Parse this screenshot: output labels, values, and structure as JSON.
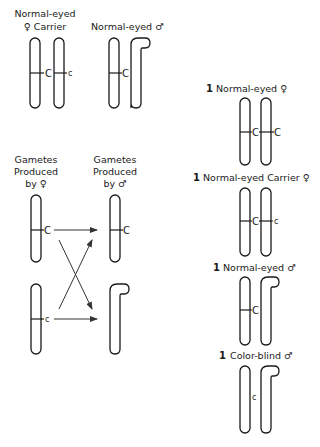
{
  "parents": {
    "female": {
      "label_line1": "Normal-eyed",
      "label_line2": "♀ Carrier",
      "alleles": [
        "C",
        "c"
      ]
    },
    "male": {
      "label": "Normal-eyed ♂",
      "alleles": [
        "C"
      ]
    }
  },
  "gametes": {
    "female_header": [
      "Gametes",
      "Produced",
      "by ♀"
    ],
    "male_header": [
      "Gametes",
      "Produced",
      "by ♂"
    ],
    "female_alleles": [
      "C",
      "c"
    ],
    "male_alleles": [
      "C"
    ]
  },
  "offspring": [
    {
      "count": "1",
      "label": "Normal-eyed ♀",
      "alleles": [
        "C",
        "C"
      ]
    },
    {
      "count": "1",
      "label": "Normal-eyed Carrier ♀",
      "alleles": [
        "C",
        "c"
      ]
    },
    {
      "count": "1",
      "label": "Normal-eyed ♂",
      "alleles": [
        "C"
      ]
    },
    {
      "count": "1",
      "label": "Color-blind ♂",
      "alleles": [
        "c"
      ]
    }
  ],
  "colors": {
    "ink": "#1a1a1a",
    "background": "#ffffff"
  }
}
